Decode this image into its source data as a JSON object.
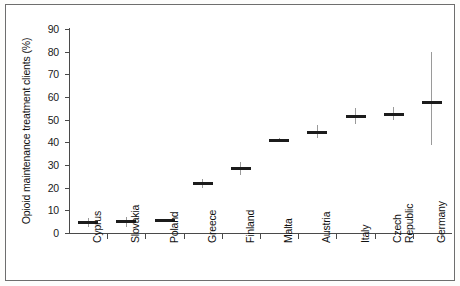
{
  "chart_data": {
    "type": "scatter",
    "title": "",
    "xlabel": "",
    "ylabel": "Opioid maintenance treatment clients (%)",
    "ylim": [
      0,
      90
    ],
    "ytick_labels": [
      "0",
      "10",
      "20",
      "30",
      "40",
      "50",
      "60",
      "70",
      "80",
      "90"
    ],
    "ytick_values": [
      0,
      10,
      20,
      30,
      40,
      50,
      60,
      70,
      80,
      90
    ],
    "grid": false,
    "legend": "none",
    "categories": [
      "Cyprus",
      "Slovakia",
      "Poland",
      "Greece",
      "Finland",
      "Malta",
      "Austria",
      "Italy",
      "Czech Republic",
      "Germany"
    ],
    "values": [
      4.5,
      5.0,
      5.5,
      22.0,
      28.5,
      41.0,
      44.5,
      51.5,
      52.5,
      57.5
    ],
    "error_low": [
      2.5,
      2.8,
      5.5,
      20.0,
      25.5,
      40.0,
      42.0,
      48.0,
      50.0,
      39.0
    ],
    "error_high": [
      6.5,
      7.2,
      5.5,
      24.0,
      31.5,
      42.0,
      47.5,
      55.0,
      55.5,
      80.0
    ],
    "series": [
      {
        "name": "Opioid maintenance treatment clients",
        "points": [
          {
            "category": "Cyprus",
            "value": 4.5,
            "low": 2.5,
            "high": 6.5
          },
          {
            "category": "Slovakia",
            "value": 5.0,
            "low": 2.8,
            "high": 7.2
          },
          {
            "category": "Poland",
            "value": 5.5,
            "low": 5.5,
            "high": 5.5
          },
          {
            "category": "Greece",
            "value": 22.0,
            "low": 20.0,
            "high": 24.0
          },
          {
            "category": "Finland",
            "value": 28.5,
            "low": 25.5,
            "high": 31.5
          },
          {
            "category": "Malta",
            "value": 41.0,
            "low": 40.0,
            "high": 42.0
          },
          {
            "category": "Austria",
            "value": 44.5,
            "low": 42.0,
            "high": 47.5
          },
          {
            "category": "Italy",
            "value": 51.5,
            "low": 48.0,
            "high": 55.0
          },
          {
            "category": "Czech Republic",
            "value": 52.5,
            "low": 50.0,
            "high": 55.5
          },
          {
            "category": "Germany",
            "value": 57.5,
            "low": 39.0,
            "high": 80.0
          }
        ]
      }
    ]
  },
  "axis": {
    "y_label": "Opioid maintenance treatment clients (%)"
  }
}
